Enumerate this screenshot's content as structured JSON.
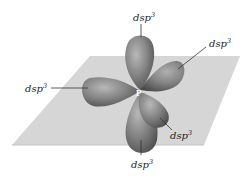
{
  "diagram": {
    "type": "trigonal bipyramidal dsp3 hybrid orbitals",
    "central_atom": "P",
    "plane_color": "#d4d4d4",
    "lobe_color": "#7a7a7a",
    "labels": [
      {
        "id": "axial-top",
        "base": "dsp",
        "sup": "3"
      },
      {
        "id": "equatorial-right",
        "base": "dsp",
        "sup": "3"
      },
      {
        "id": "equatorial-left",
        "base": "dsp",
        "sup": "3"
      },
      {
        "id": "equatorial-front",
        "base": "dsp",
        "sup": "3"
      },
      {
        "id": "axial-bottom",
        "base": "dsp",
        "sup": "3"
      }
    ]
  }
}
